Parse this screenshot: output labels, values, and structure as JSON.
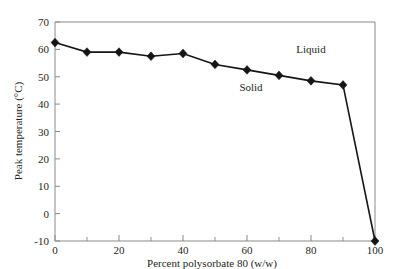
{
  "chart_data": {
    "type": "line",
    "title": "",
    "xlabel": "Percent polysorbate 80 (w/w)",
    "ylabel": "Peak temperature (°C)",
    "xlim": [
      0,
      100
    ],
    "ylim": [
      -10,
      70
    ],
    "x": [
      0,
      10,
      20,
      30,
      40,
      50,
      60,
      70,
      80,
      90,
      100
    ],
    "values": [
      62.5,
      59.0,
      59.0,
      57.5,
      58.5,
      54.5,
      52.5,
      50.5,
      48.5,
      47.0,
      -10.0
    ],
    "series": [
      {
        "name": "Peak temperature",
        "x": [
          0,
          10,
          20,
          30,
          40,
          50,
          60,
          70,
          80,
          90,
          100
        ],
        "values": [
          62.5,
          59.0,
          59.0,
          57.5,
          58.5,
          54.5,
          52.5,
          50.5,
          48.5,
          47.0,
          -10.0
        ],
        "marker": "diamond",
        "color": "#151515"
      }
    ],
    "xticks": [
      0,
      20,
      40,
      60,
      80,
      100
    ],
    "xtick_labels": [
      "0",
      "20",
      "40",
      "60",
      "80",
      "100"
    ],
    "xminor_ticks": [
      10,
      30,
      50,
      70,
      90
    ],
    "yticks": [
      -10,
      0,
      10,
      20,
      30,
      40,
      50,
      60,
      70
    ],
    "ytick_labels": [
      "-10",
      "0",
      "10",
      "20",
      "30",
      "40",
      "50",
      "60",
      "70"
    ],
    "grid": false,
    "legend": "none",
    "annotations": [
      {
        "text": "Solid",
        "x": 62,
        "y": 40.5
      },
      {
        "text": "Liquid",
        "x": 82,
        "y": 54.5
      }
    ]
  },
  "axes": {
    "x_title": "Percent polysorbate 80 (w/w)",
    "y_title": "Peak temperature (°C)"
  },
  "annotations": {
    "solid": "Solid",
    "liquid": "Liquid"
  },
  "colors": {
    "line": "#151515",
    "marker": "#151515",
    "frame": "#8a8a8a",
    "text": "#231f20",
    "background": "#ffffff"
  }
}
